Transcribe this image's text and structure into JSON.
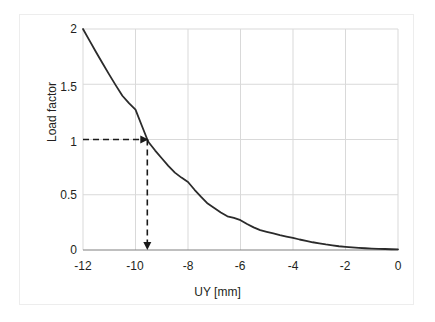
{
  "chart_data": {
    "type": "line",
    "title": "",
    "subtitle": "",
    "xlabel": "UY [mm]",
    "ylabel": "Load factor",
    "xlim": [
      -12,
      0
    ],
    "ylim": [
      0,
      2
    ],
    "xticks": [
      "-12",
      "-10",
      "-8",
      "-6",
      "-4",
      "-2",
      "0"
    ],
    "xtick_values": [
      -12,
      -10,
      -8,
      -6,
      -4,
      -2,
      0
    ],
    "yticks": [
      "0",
      "0.5",
      "1",
      "1.5",
      "2"
    ],
    "ytick_values": [
      0,
      0.5,
      1,
      1.5,
      2
    ],
    "grid": true,
    "grid_color": "#d9d9d9",
    "legend": null,
    "line_color": "#2b2b2b",
    "line_width": 1.8,
    "series": [
      {
        "name": "Load factor curve",
        "x": [
          -12.0,
          -11.75,
          -11.5,
          -11.25,
          -11.0,
          -10.75,
          -10.5,
          -10.25,
          -10.0,
          -9.75,
          -9.55,
          -9.5,
          -9.25,
          -9.0,
          -8.75,
          -8.5,
          -8.25,
          -8.0,
          -7.75,
          -7.5,
          -7.25,
          -7.0,
          -6.75,
          -6.5,
          -6.25,
          -6.0,
          -5.75,
          -5.5,
          -5.25,
          -5.0,
          -4.75,
          -4.5,
          -4.25,
          -4.0,
          -3.75,
          -3.5,
          -3.25,
          -3.0,
          -2.75,
          -2.5,
          -2.25,
          -2.0,
          -1.75,
          -1.5,
          -1.25,
          -1.0,
          -0.75,
          -0.5,
          -0.25,
          0.0
        ],
        "y": [
          2.0,
          1.895,
          1.79,
          1.688,
          1.587,
          1.49,
          1.396,
          1.329,
          1.271,
          1.12,
          1.0,
          0.975,
          0.9,
          0.83,
          0.762,
          0.7,
          0.655,
          0.615,
          0.545,
          0.48,
          0.42,
          0.38,
          0.34,
          0.305,
          0.29,
          0.27,
          0.235,
          0.205,
          0.18,
          0.165,
          0.15,
          0.135,
          0.122,
          0.11,
          0.095,
          0.082,
          0.07,
          0.06,
          0.05,
          0.042,
          0.034,
          0.028,
          0.023,
          0.019,
          0.016,
          0.013,
          0.011,
          0.009,
          0.007,
          0.005
        ]
      }
    ],
    "annotations": [
      {
        "name": "horizontal-guide",
        "type": "dashed-arrow",
        "from": [
          -12,
          1
        ],
        "to": [
          -9.55,
          1
        ],
        "label": ""
      },
      {
        "name": "vertical-guide",
        "type": "dashed-arrow",
        "from": [
          -9.55,
          1
        ],
        "to": [
          -9.55,
          0
        ],
        "label": ""
      }
    ]
  },
  "axes": {
    "x_label": "UY [mm]",
    "y_label": "Load factor",
    "x_tick_labels": [
      "-12",
      "-10",
      "-8",
      "-6",
      "-4",
      "-2",
      "0"
    ],
    "y_tick_labels": [
      "2",
      "1.5",
      "1",
      "0.5",
      "0"
    ]
  }
}
